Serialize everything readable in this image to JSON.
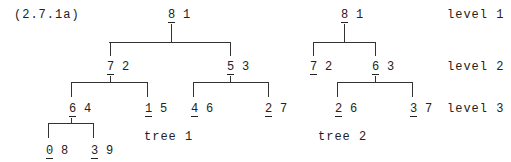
{
  "equation_label": "(2.7.1a)",
  "levels": [
    "level 1",
    "level 2",
    "level 3"
  ],
  "tree1": {
    "caption": "tree 1",
    "nodes": {
      "root": {
        "key": "8",
        "value": "1"
      },
      "l": {
        "key": "7",
        "value": "2"
      },
      "r": {
        "key": "5",
        "value": "3"
      },
      "ll": {
        "key": "6",
        "value": "4"
      },
      "lr": {
        "key": "1",
        "value": "5"
      },
      "rl": {
        "key": "4",
        "value": "6"
      },
      "rr": {
        "key": "2",
        "value": "7"
      },
      "lll": {
        "key": "0",
        "value": "8"
      },
      "llr": {
        "key": "3",
        "value": "9"
      }
    }
  },
  "tree2": {
    "caption": "tree 2",
    "nodes": {
      "root": {
        "key": "8",
        "value": "1"
      },
      "l": {
        "key": "7",
        "value": "2"
      },
      "r": {
        "key": "6",
        "value": "3"
      },
      "rl": {
        "key": "2",
        "value": "6"
      },
      "rr": {
        "key": "3",
        "value": "7"
      }
    }
  }
}
